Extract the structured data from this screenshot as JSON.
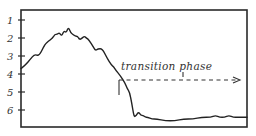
{
  "chart_data": {
    "type": "line",
    "title": "",
    "xlabel": "",
    "ylabel": "",
    "y_axis": {
      "inverted": true,
      "ticks": [
        1,
        2,
        3,
        4,
        5,
        6
      ],
      "tick_labels": [
        "1",
        "2",
        "3",
        "4",
        "5",
        "6"
      ],
      "range": [
        0.5,
        7.0
      ]
    },
    "x_axis": {
      "ticks": [],
      "range": [
        0,
        100
      ]
    },
    "grid": false,
    "legend": null,
    "series": [
      {
        "name": "curve",
        "x": [
          0,
          2,
          4,
          6,
          8,
          10,
          11,
          12,
          14,
          15,
          16,
          17,
          18,
          19,
          20,
          21,
          22,
          23,
          24,
          25,
          26,
          27,
          28,
          29,
          30,
          32,
          33,
          34,
          36,
          38,
          40,
          41,
          42,
          44,
          46,
          47,
          48,
          49,
          50,
          51,
          52,
          53,
          54,
          55,
          56,
          58,
          60,
          64,
          68,
          72,
          76,
          80,
          84,
          86,
          88,
          90,
          92,
          94,
          96,
          98,
          100
        ],
        "y": [
          3.7,
          3.5,
          3.2,
          2.9,
          3.0,
          2.5,
          2.3,
          2.2,
          2.0,
          1.8,
          1.8,
          1.7,
          1.9,
          1.6,
          1.7,
          1.4,
          1.7,
          1.8,
          1.9,
          1.9,
          2.1,
          2.0,
          1.9,
          2.0,
          2.1,
          2.5,
          2.7,
          2.6,
          2.6,
          3.1,
          3.5,
          3.6,
          3.8,
          4.1,
          4.5,
          4.8,
          5.0,
          5.6,
          6.4,
          6.3,
          6.1,
          6.3,
          6.3,
          6.4,
          6.4,
          6.5,
          6.5,
          6.6,
          6.6,
          6.5,
          6.5,
          6.4,
          6.4,
          6.3,
          6.4,
          6.4,
          6.3,
          6.4,
          6.4,
          6.4,
          6.4
        ]
      }
    ],
    "annotations": [
      {
        "text": "transition phase",
        "type": "dashed-arrow",
        "x_start": 48,
        "x_end": 100,
        "y": 4.7,
        "start_marker": "vertical-bar",
        "mid_marker": "short-tick"
      }
    ]
  },
  "labels": {
    "annotation_text": "transition phase",
    "y_ticks": [
      "1",
      "2",
      "3",
      "4",
      "5",
      "6"
    ]
  }
}
